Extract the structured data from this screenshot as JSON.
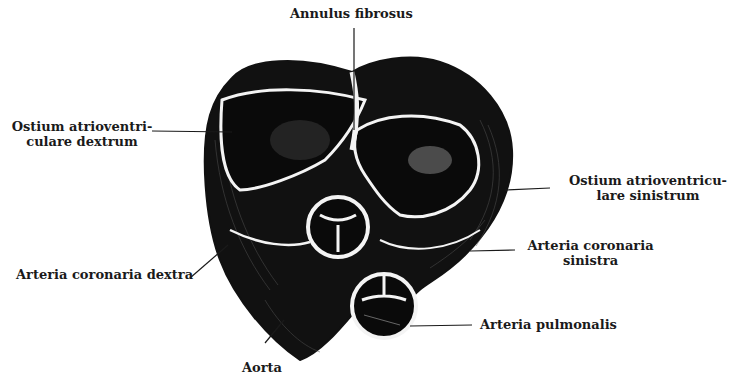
{
  "figure": {
    "type": "anatomical illustration"
  },
  "labels": {
    "annulus_fibrosus": "Annulus fibrosus",
    "ostium_av_dextrum_line1": "Ostium atrioventri-",
    "ostium_av_dextrum_line2": "culare dextrum",
    "ostium_av_sinistrum_line1": "Ostium atrioventricu-",
    "ostium_av_sinistrum_line2": "lare sinistrum",
    "arteria_coronaria_sinistra_line1": "Arteria coronaria",
    "arteria_coronaria_sinistra_line2": "sinistra",
    "arteria_coronaria_dextra": "Arteria coronaria dextra",
    "arteria_pulmonalis": "Arteria pulmonalis",
    "aorta": "Aorta"
  },
  "colors": {
    "ink": "#1a1a1a",
    "paper": "#ffffff"
  }
}
